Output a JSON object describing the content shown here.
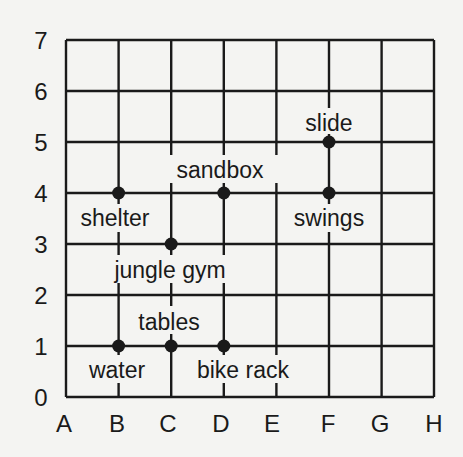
{
  "grid": {
    "columns": [
      "A",
      "B",
      "C",
      "D",
      "E",
      "F",
      "G",
      "H"
    ],
    "rows": [
      "0",
      "1",
      "2",
      "3",
      "4",
      "5",
      "6",
      "7"
    ]
  },
  "points": [
    {
      "name": "slide",
      "col": "F",
      "row": 5,
      "label": "slide"
    },
    {
      "name": "sandbox",
      "col": "D",
      "row": 4,
      "label": "sandbox"
    },
    {
      "name": "shelter",
      "col": "B",
      "row": 4,
      "label": "shelter"
    },
    {
      "name": "swings",
      "col": "F",
      "row": 4,
      "label": "swings"
    },
    {
      "name": "jungle-gym",
      "col": "C",
      "row": 3,
      "label": "jungle gym"
    },
    {
      "name": "tables",
      "col": "C",
      "row": 1,
      "label": "tables"
    },
    {
      "name": "water",
      "col": "B",
      "row": 1,
      "label": "water"
    },
    {
      "name": "bike-rack",
      "col": "D",
      "row": 1,
      "label": "bike rack"
    }
  ],
  "colors": {
    "line": "#1a1a1a",
    "background": "#f4f4f2"
  }
}
